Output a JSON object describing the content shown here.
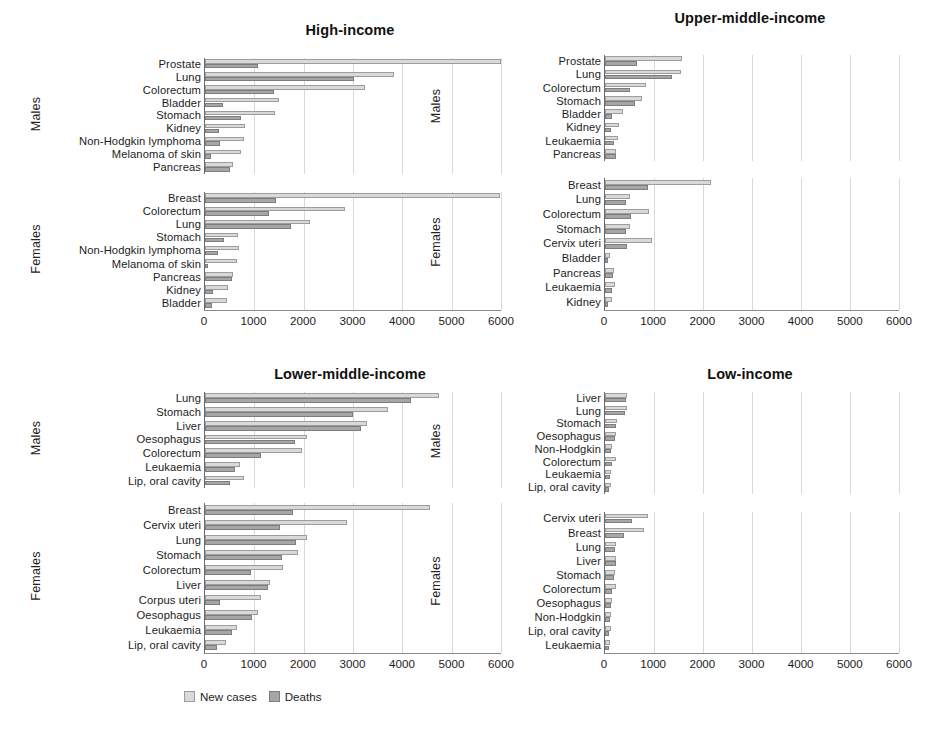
{
  "figure": {
    "axis_max": 6000,
    "ticks": [
      0,
      1000,
      2000,
      3000,
      4000,
      5000,
      6000
    ],
    "sex_labels": {
      "males": "Males",
      "females": "Females"
    },
    "colors": {
      "new_cases": "#d9d9d9",
      "deaths": "#a6a6a6",
      "grid": "#d8d8d8",
      "axis": "#6b6b6b"
    }
  },
  "legend": {
    "items": [
      {
        "label": "New cases",
        "key": "cases"
      },
      {
        "label": "Deaths",
        "key": "deaths"
      }
    ]
  },
  "chart_data": {
    "type": "bar",
    "xlabel": "",
    "ylabel": "",
    "xlim": [
      0,
      6000
    ],
    "grid": true,
    "legend_position": "bottom-left",
    "orientation": "horizontal",
    "series_names": [
      "New cases",
      "Deaths"
    ],
    "panels": [
      {
        "title": "High-income",
        "position": "top-left",
        "groups": [
          {
            "sex": "Males",
            "categories": [
              "Prostate",
              "Lung",
              "Colorectum",
              "Bladder",
              "Stomach",
              "Kidney",
              "Non-Hodgkin lymphoma",
              "Melanoma of skin",
              "Pancreas"
            ],
            "new_cases": [
              5990,
              3840,
              3250,
              1490,
              1420,
              820,
              800,
              730,
              560
            ],
            "deaths": [
              1080,
              3020,
              1390,
              360,
              720,
              280,
              300,
              130,
              510
            ]
          },
          {
            "sex": "Females",
            "categories": [
              "Breast",
              "Colorectum",
              "Lung",
              "Stomach",
              "Non-Hodgkin lymphoma",
              "Melanoma of skin",
              "Pancreas",
              "Kidney",
              "Bladder"
            ],
            "new_cases": [
              5980,
              2840,
              2130,
              670,
              680,
              650,
              570,
              460,
              440
            ],
            "deaths": [
              1440,
              1290,
              1740,
              380,
              260,
              70,
              540,
              160,
              140
            ]
          }
        ]
      },
      {
        "title": "Upper-middle-income",
        "position": "top-right",
        "groups": [
          {
            "sex": "Males",
            "categories": [
              "Prostate",
              "Lung",
              "Colorectum",
              "Stomach",
              "Bladder",
              "Kidney",
              "Leukaemia",
              "Pancreas"
            ],
            "new_cases": [
              1580,
              1560,
              830,
              760,
              370,
              280,
              270,
              230
            ],
            "deaths": [
              660,
              1370,
              500,
              620,
              140,
              130,
              190,
              220
            ]
          },
          {
            "sex": "Females",
            "categories": [
              "Breast",
              "Lung",
              "Colorectum",
              "Stomach",
              "Cervix uteri",
              "Bladder",
              "Pancreas",
              "Leukaemia",
              "Kidney"
            ],
            "new_cases": [
              2160,
              510,
              890,
              520,
              950,
              110,
              180,
              210,
              150
            ],
            "deaths": [
              880,
              420,
              530,
              430,
              440,
              60,
              170,
              150,
              70
            ]
          }
        ]
      },
      {
        "title": "Lower-middle-income",
        "position": "bottom-left",
        "groups": [
          {
            "sex": "Males",
            "categories": [
              "Lung",
              "Stomach",
              "Liver",
              "Oesophagus",
              "Colorectum",
              "Leukaemia",
              "Lip, oral cavity"
            ],
            "new_cases": [
              4750,
              3710,
              3290,
              2070,
              1960,
              710,
              800
            ],
            "deaths": [
              4180,
              3000,
              3160,
              1820,
              1140,
              610,
              510
            ]
          },
          {
            "sex": "Females",
            "categories": [
              "Breast",
              "Cervix uteri",
              "Lung",
              "Stomach",
              "Colorectum",
              "Liver",
              "Corpus uteri",
              "Oesophagus",
              "Leukaemia",
              "Lip, oral cavity"
            ],
            "new_cases": [
              4560,
              2880,
              2070,
              1880,
              1590,
              1320,
              1130,
              1070,
              640,
              430
            ],
            "deaths": [
              1780,
              1520,
              1850,
              1570,
              930,
              1270,
              310,
              950,
              540,
              240
            ]
          }
        ]
      },
      {
        "title": "Low-income",
        "position": "bottom-right",
        "groups": [
          {
            "sex": "Males",
            "categories": [
              "Liver",
              "Lung",
              "Stomach",
              "Oesophagus",
              "Non-Hodgkin",
              "Colorectum",
              "Leukaemia",
              "Lip, oral cavity"
            ],
            "new_cases": [
              440,
              450,
              250,
              230,
              150,
              230,
              130,
              130
            ],
            "deaths": [
              420,
              410,
              230,
              210,
              120,
              150,
              110,
              90
            ]
          },
          {
            "sex": "Females",
            "categories": [
              "Cervix uteri",
              "Breast",
              "Lung",
              "Liver",
              "Stomach",
              "Colorectum",
              "Oesophagus",
              "Non-Hodgkin",
              "Lip, oral cavity",
              "Leukaemia"
            ],
            "new_cases": [
              880,
              800,
              230,
              230,
              200,
              220,
              140,
              130,
              120,
              110
            ],
            "deaths": [
              560,
              390,
              210,
              220,
              180,
              140,
              130,
              100,
              90,
              90
            ]
          }
        ]
      }
    ]
  }
}
